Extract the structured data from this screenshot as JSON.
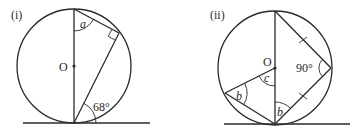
{
  "figures": [
    {
      "id": "i",
      "label": "(i)",
      "center_label": "O",
      "angles": {
        "a": "a",
        "tangent_chord": "68°"
      },
      "right_angle_marker": true
    },
    {
      "id": "ii",
      "label": "(ii)",
      "center_label": "O",
      "angles": {
        "b_left": "b",
        "b_bottom": "b",
        "c": "c",
        "right": "90°"
      },
      "equal_tick_marks": 2
    }
  ]
}
